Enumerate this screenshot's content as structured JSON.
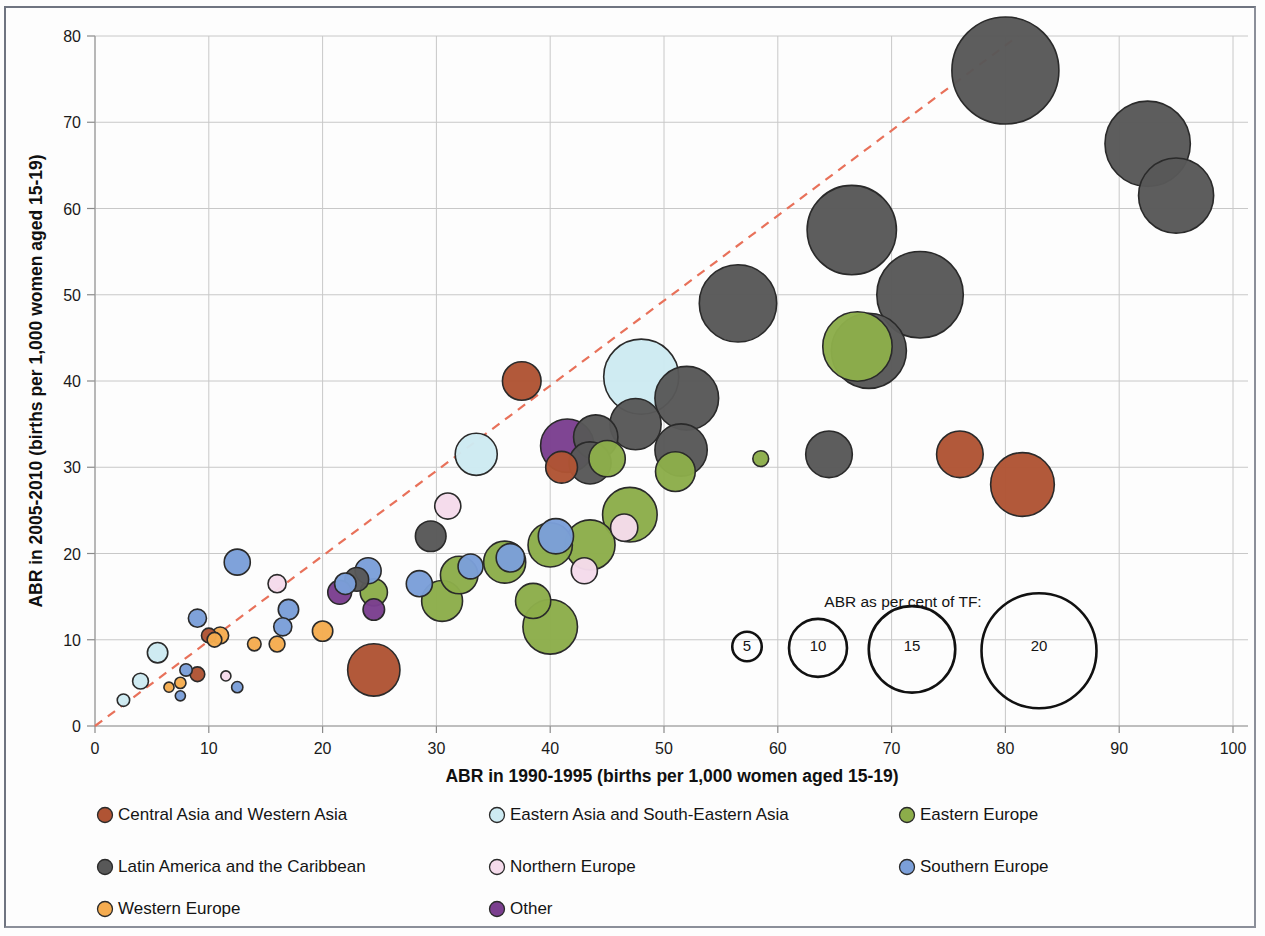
{
  "chart_data": {
    "type": "scatter",
    "title": "",
    "xlabel": "ABR in 1990-1995 (births per 1,000 women aged 15-19)",
    "ylabel": "ABR in 2005-2010 (births per 1,000 women aged 15-19)",
    "xlim": [
      0,
      100
    ],
    "ylim": [
      0,
      80
    ],
    "xticks": [
      0,
      10,
      20,
      30,
      40,
      50,
      60,
      70,
      80,
      90,
      100
    ],
    "yticks": [
      0,
      10,
      20,
      30,
      40,
      50,
      60,
      70,
      80
    ],
    "grid": true,
    "legend_position": "below",
    "reference_line": {
      "label": "y = x diagonal",
      "style": "dashed",
      "color": "#e8715a",
      "from": [
        0,
        0
      ],
      "to": [
        80,
        80
      ]
    },
    "size_encoding": {
      "title": "ABR as per cent of TF:",
      "values": [
        5,
        10,
        15,
        20
      ],
      "unit": "per cent"
    },
    "series": [
      {
        "name": "Central Asia and Western Asia",
        "color": "#b05434",
        "fill": "#b05434"
      },
      {
        "name": "Eastern Asia and South-Eastern Asia",
        "color": "#cdeaf2",
        "fill": "#cdeaf2"
      },
      {
        "name": "Eastern Europe",
        "color": "#8cad4a",
        "fill": "#8cad4a"
      },
      {
        "name": "Latin America and the Caribbean",
        "color": "#585858",
        "fill": "#585858"
      },
      {
        "name": "Northern Europe",
        "color": "#f5dbeb",
        "fill": "#f5dbeb"
      },
      {
        "name": "Southern Europe",
        "color": "#7b9fd9",
        "fill": "#7b9fd9"
      },
      {
        "name": "Western Europe",
        "color": "#f5ac50",
        "fill": "#f5ac50"
      },
      {
        "name": "Other",
        "color": "#7b3f8f",
        "fill": "#7b3f8f"
      }
    ],
    "points": [
      {
        "g": 3,
        "x": 80.0,
        "y": 76.0,
        "s": 18.6
      },
      {
        "g": 3,
        "x": 92.5,
        "y": 67.5,
        "s": 14.8
      },
      {
        "g": 3,
        "x": 95.0,
        "y": 61.5,
        "s": 13.0
      },
      {
        "g": 3,
        "x": 66.5,
        "y": 57.5,
        "s": 15.5
      },
      {
        "g": 3,
        "x": 72.5,
        "y": 50.0,
        "s": 15.0
      },
      {
        "g": 3,
        "x": 56.5,
        "y": 49.0,
        "s": 13.4
      },
      {
        "g": 3,
        "x": 68.0,
        "y": 43.5,
        "s": 13.0
      },
      {
        "g": 2,
        "x": 67.0,
        "y": 44.0,
        "s": 12.0
      },
      {
        "g": 3,
        "x": 52.0,
        "y": 38.0,
        "s": 11.0
      },
      {
        "g": 3,
        "x": 51.5,
        "y": 32.0,
        "s": 9.0
      },
      {
        "g": 3,
        "x": 64.5,
        "y": 31.5,
        "s": 8.0
      },
      {
        "g": 3,
        "x": 47.5,
        "y": 35.0,
        "s": 8.8
      },
      {
        "g": 3,
        "x": 44.0,
        "y": 33.5,
        "s": 7.6
      },
      {
        "g": 3,
        "x": 43.5,
        "y": 30.5,
        "s": 7.2
      },
      {
        "g": 3,
        "x": 29.5,
        "y": 22.0,
        "s": 5.2
      },
      {
        "g": 3,
        "x": 23.0,
        "y": 17.0,
        "s": 4.0
      },
      {
        "g": 1,
        "x": 48.0,
        "y": 40.5,
        "s": 13.0
      },
      {
        "g": 1,
        "x": 33.5,
        "y": 31.5,
        "s": 7.2
      },
      {
        "g": 1,
        "x": 5.5,
        "y": 8.5,
        "s": 3.4
      },
      {
        "g": 1,
        "x": 4.0,
        "y": 5.2,
        "s": 2.6
      },
      {
        "g": 1,
        "x": 2.5,
        "y": 3.0,
        "s": 2.0
      },
      {
        "g": 0,
        "x": 37.5,
        "y": 40.0,
        "s": 6.6
      },
      {
        "g": 0,
        "x": 41.0,
        "y": 30.0,
        "s": 5.4
      },
      {
        "g": 0,
        "x": 76.0,
        "y": 31.5,
        "s": 8.0
      },
      {
        "g": 0,
        "x": 81.5,
        "y": 28.0,
        "s": 11.0
      },
      {
        "g": 0,
        "x": 24.5,
        "y": 6.5,
        "s": 9.0
      },
      {
        "g": 0,
        "x": 9.0,
        "y": 6.0,
        "s": 2.4
      },
      {
        "g": 0,
        "x": 10.0,
        "y": 10.5,
        "s": 2.4
      },
      {
        "g": 7,
        "x": 41.5,
        "y": 32.5,
        "s": 9.2
      },
      {
        "g": 7,
        "x": 21.5,
        "y": 15.5,
        "s": 4.0
      },
      {
        "g": 7,
        "x": 24.5,
        "y": 13.5,
        "s": 3.6
      },
      {
        "g": 2,
        "x": 58.5,
        "y": 31.0,
        "s": 2.6
      },
      {
        "g": 2,
        "x": 51.0,
        "y": 29.5,
        "s": 6.8
      },
      {
        "g": 2,
        "x": 45.0,
        "y": 31.0,
        "s": 6.2
      },
      {
        "g": 2,
        "x": 47.0,
        "y": 24.5,
        "s": 9.4
      },
      {
        "g": 2,
        "x": 43.5,
        "y": 21.0,
        "s": 8.6
      },
      {
        "g": 2,
        "x": 40.0,
        "y": 21.0,
        "s": 7.6
      },
      {
        "g": 2,
        "x": 36.0,
        "y": 19.0,
        "s": 7.2
      },
      {
        "g": 2,
        "x": 32.0,
        "y": 17.5,
        "s": 6.4
      },
      {
        "g": 2,
        "x": 30.5,
        "y": 14.5,
        "s": 7.0
      },
      {
        "g": 2,
        "x": 24.5,
        "y": 15.5,
        "s": 4.6
      },
      {
        "g": 2,
        "x": 40.0,
        "y": 11.5,
        "s": 9.4
      },
      {
        "g": 2,
        "x": 38.5,
        "y": 14.5,
        "s": 6.0
      },
      {
        "g": 5,
        "x": 40.5,
        "y": 22.0,
        "s": 6.0
      },
      {
        "g": 5,
        "x": 36.5,
        "y": 19.5,
        "s": 4.8
      },
      {
        "g": 5,
        "x": 33.0,
        "y": 18.5,
        "s": 4.2
      },
      {
        "g": 5,
        "x": 28.5,
        "y": 16.5,
        "s": 4.4
      },
      {
        "g": 5,
        "x": 24.0,
        "y": 18.0,
        "s": 4.4
      },
      {
        "g": 5,
        "x": 22.0,
        "y": 16.5,
        "s": 3.6
      },
      {
        "g": 5,
        "x": 17.0,
        "y": 13.5,
        "s": 3.4
      },
      {
        "g": 5,
        "x": 16.5,
        "y": 11.5,
        "s": 3.0
      },
      {
        "g": 5,
        "x": 12.5,
        "y": 19.0,
        "s": 4.4
      },
      {
        "g": 5,
        "x": 9.0,
        "y": 12.5,
        "s": 3.0
      },
      {
        "g": 5,
        "x": 8.0,
        "y": 6.5,
        "s": 2.0
      },
      {
        "g": 5,
        "x": 12.5,
        "y": 4.5,
        "s": 1.8
      },
      {
        "g": 5,
        "x": 7.5,
        "y": 3.5,
        "s": 1.6
      },
      {
        "g": 4,
        "x": 46.5,
        "y": 23.0,
        "s": 4.6
      },
      {
        "g": 4,
        "x": 43.0,
        "y": 18.0,
        "s": 4.4
      },
      {
        "g": 4,
        "x": 31.0,
        "y": 25.5,
        "s": 4.4
      },
      {
        "g": 4,
        "x": 16.0,
        "y": 16.5,
        "s": 3.0
      },
      {
        "g": 4,
        "x": 11.5,
        "y": 5.8,
        "s": 1.6
      },
      {
        "g": 6,
        "x": 20.0,
        "y": 11.0,
        "s": 3.4
      },
      {
        "g": 6,
        "x": 16.0,
        "y": 9.5,
        "s": 2.6
      },
      {
        "g": 6,
        "x": 14.0,
        "y": 9.5,
        "s": 2.2
      },
      {
        "g": 6,
        "x": 11.0,
        "y": 10.5,
        "s": 2.8
      },
      {
        "g": 6,
        "x": 10.5,
        "y": 10.0,
        "s": 2.4
      },
      {
        "g": 6,
        "x": 7.5,
        "y": 5.0,
        "s": 1.8
      },
      {
        "g": 6,
        "x": 6.5,
        "y": 4.5,
        "s": 1.6
      }
    ]
  },
  "axes": {
    "x_title": "ABR in 1990-1995 (births per 1,000 women aged 15-19)",
    "y_title": "ABR in 2005-2010 (births per 1,000 women aged 15-19)",
    "x_ticks": [
      "0",
      "10",
      "20",
      "30",
      "40",
      "50",
      "60",
      "70",
      "80",
      "90",
      "100"
    ],
    "y_ticks": [
      "0",
      "10",
      "20",
      "30",
      "40",
      "50",
      "60",
      "70",
      "80"
    ]
  },
  "size_legend": {
    "title": "ABR as per cent of TF:",
    "items": [
      {
        "label": "5"
      },
      {
        "label": "10"
      },
      {
        "label": "15"
      },
      {
        "label": "20"
      }
    ]
  },
  "legend": {
    "items": [
      {
        "label": "Central Asia and Western Asia",
        "color": "#b05434"
      },
      {
        "label": "Eastern Asia and South-Eastern Asia",
        "color": "#cdeaf2"
      },
      {
        "label": "Eastern Europe",
        "color": "#8cad4a"
      },
      {
        "label": "Latin America and the Caribbean",
        "color": "#585858"
      },
      {
        "label": "Northern Europe",
        "color": "#f5dbeb"
      },
      {
        "label": "Southern Europe",
        "color": "#7b9fd9"
      },
      {
        "label": "Western Europe",
        "color": "#f5ac50"
      },
      {
        "label": "Other",
        "color": "#7b3f8f"
      }
    ]
  }
}
